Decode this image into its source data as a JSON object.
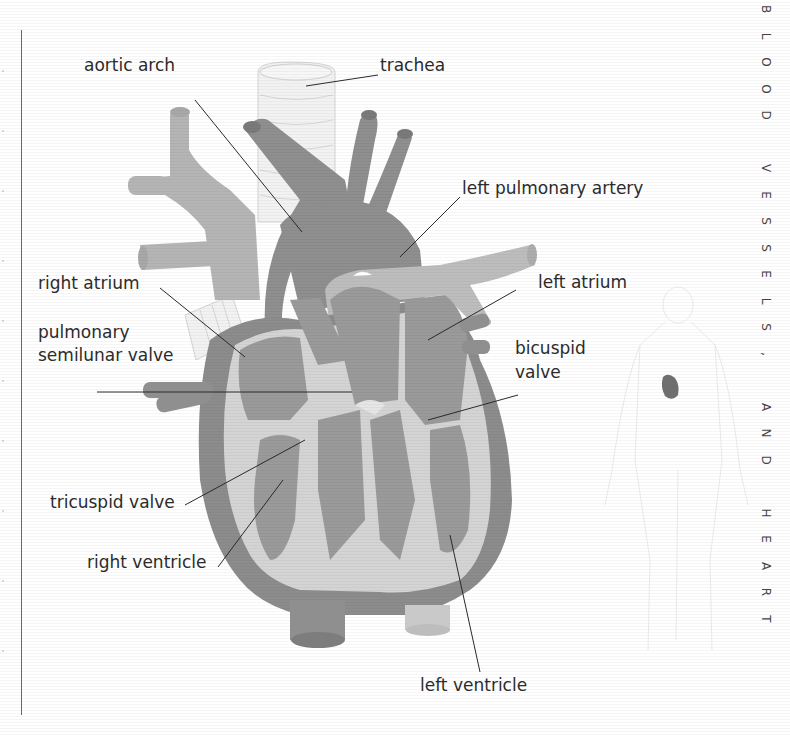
{
  "side_title": "BLOOD VESSELS, AND HEART",
  "side_title_letters": [
    "B",
    "L",
    "O",
    "O",
    "D",
    "",
    "V",
    "E",
    "S",
    "S",
    "E",
    "L",
    "S",
    ",",
    "",
    "A",
    "N",
    "D",
    "",
    "H",
    "E",
    "A",
    "R",
    "T"
  ],
  "labels": {
    "aortic_arch": "aortic arch",
    "trachea": "trachea",
    "left_pulmonary_artery": "left pulmonary artery",
    "right_atrium": "right atrium",
    "left_atrium": "left atrium",
    "pulmonary_semilunar_valve_line1": "pulmonary",
    "pulmonary_semilunar_valve_line2": "semilunar valve",
    "bicuspid_valve_line1": "bicuspid",
    "bicuspid_valve_line2": "valve",
    "tricuspid_valve": "tricuspid valve",
    "right_ventricle": "right ventricle",
    "left_ventricle": "left ventricle"
  },
  "colors": {
    "muscle": "#8f8f8f",
    "chamber": "#9a9a9a",
    "vessel_light": "#b9b9b9",
    "valve_light": "#d6d6d6",
    "trachea": "#f0f0f0",
    "leader_line": "#2a2a2a"
  },
  "inset": {
    "description": "human body outline with heart location"
  }
}
